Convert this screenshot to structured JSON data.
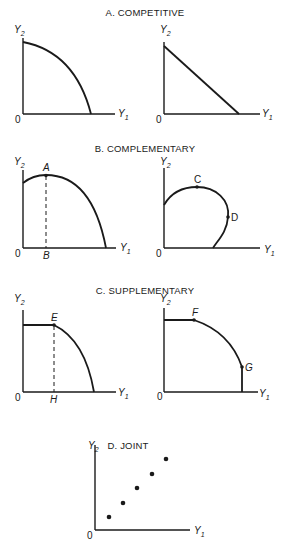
{
  "figure": {
    "panels": [
      {
        "id": "A",
        "title": "A. COMPETITIVE",
        "subplots": [
          {
            "curve_shape": "concave-to-origin",
            "y_label": "Y",
            "y_sub": "2",
            "x_label": "Y",
            "x_sub": "1",
            "origin": "0",
            "points": []
          },
          {
            "curve_shape": "straight-line",
            "y_label": "Y",
            "y_sub": "2",
            "x_label": "Y",
            "x_sub": "1",
            "origin": "0",
            "points": []
          }
        ]
      },
      {
        "id": "B",
        "title": "B. COMPLEMENTARY",
        "subplots": [
          {
            "curve_shape": "rising-then-falling",
            "y_label": "Y",
            "y_sub": "2",
            "x_label": "Y",
            "x_sub": "1",
            "origin": "0",
            "points": [
              "A"
            ],
            "axis_marks": [
              "B"
            ]
          },
          {
            "curve_shape": "looping",
            "y_label": "Y",
            "y_sub": "2",
            "x_label": "Y",
            "x_sub": "1",
            "origin": "0",
            "points": [
              "C",
              "D"
            ]
          }
        ]
      },
      {
        "id": "C",
        "title": "C. SUPPLEMENTARY",
        "subplots": [
          {
            "curve_shape": "flat-then-concave",
            "y_label": "Y",
            "y_sub": "2",
            "x_label": "Y",
            "x_sub": "1",
            "origin": "0",
            "points": [
              "E"
            ],
            "axis_marks": [
              "H"
            ]
          },
          {
            "curve_shape": "flat-concave-vertical",
            "y_label": "Y",
            "y_sub": "2",
            "x_label": "Y",
            "x_sub": "1",
            "origin": "0",
            "points": [
              "F",
              "G"
            ]
          }
        ]
      },
      {
        "id": "D",
        "title": "D. JOINT",
        "subplots": [
          {
            "curve_shape": "discrete-points",
            "y_label": "Y",
            "y_sub": "2",
            "x_label": "Y",
            "x_sub": "1",
            "origin": "0",
            "points": [],
            "dot_count": 5
          }
        ]
      }
    ]
  }
}
